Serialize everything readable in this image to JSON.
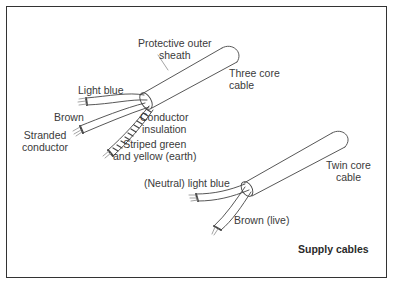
{
  "diagram": {
    "title": "Supply cables",
    "three_core": {
      "name_line1": "Three core",
      "name_line2": "cable",
      "sheath_line1": "Protective outer",
      "sheath_line2": "sheath",
      "light_blue": "Light blue",
      "brown": "Brown",
      "stranded_line1": "Stranded",
      "stranded_line2": "conductor",
      "insulation_line1": "Conductor",
      "insulation_line2": "insulation",
      "earth_line1": "Striped green",
      "earth_line2": "and yellow (earth)"
    },
    "twin_core": {
      "name_line1": "Twin core",
      "name_line2": "cable",
      "neutral": "(Neutral) light blue",
      "live": "Brown (live)"
    }
  }
}
